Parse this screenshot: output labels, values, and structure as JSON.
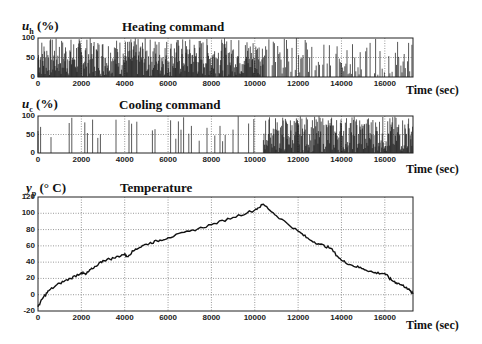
{
  "chart_data": [
    {
      "type": "line",
      "title": "Heating command",
      "ylabel_var": "u",
      "ylabel_sub": "h",
      "ylabel_unit": "(%)",
      "xlabel": "Time (sec)",
      "xlim": [
        0,
        17300
      ],
      "ylim": [
        0,
        100
      ],
      "xticks": [
        0,
        2000,
        4000,
        6000,
        8000,
        10000,
        12000,
        14000,
        16000
      ],
      "yticks": [
        0,
        50,
        100
      ],
      "grid": true,
      "description": "Dense rapidly switching signal between 0 and 100% over entire time span; heavier in first half (0-10400 s), sparser spikes afterwards",
      "segments": [
        {
          "x_start": 0,
          "x_end": 10400,
          "mean": 55,
          "density": "high"
        },
        {
          "x_start": 10400,
          "x_end": 17300,
          "mean": 45,
          "density": "medium"
        }
      ]
    },
    {
      "type": "line",
      "title": "Cooling command",
      "ylabel_var": "u",
      "ylabel_sub": "c",
      "ylabel_unit": "(%)",
      "xlabel": "Time (sec)",
      "xlim": [
        0,
        17300
      ],
      "ylim": [
        0,
        100
      ],
      "xticks": [
        0,
        2000,
        4000,
        6000,
        8000,
        10000,
        12000,
        14000,
        16000
      ],
      "yticks": [
        0,
        50,
        100
      ],
      "grid": true,
      "description": "Sparse spikes 0-100% before ~10400 s, then dense switching after ~10400 s",
      "segments": [
        {
          "x_start": 0,
          "x_end": 10400,
          "mean": 15,
          "density": "low"
        },
        {
          "x_start": 10400,
          "x_end": 17300,
          "mean": 55,
          "density": "high"
        }
      ]
    },
    {
      "type": "line",
      "title": "Temperature",
      "ylabel_var": "y",
      "ylabel_sub": "p",
      "ylabel_unit": "(° C)",
      "xlabel": "Time (sec)",
      "xlim": [
        0,
        17300
      ],
      "ylim": [
        -20,
        120
      ],
      "xticks": [
        0,
        2000,
        4000,
        6000,
        8000,
        10000,
        12000,
        14000,
        16000
      ],
      "yticks": [
        -20,
        0,
        20,
        40,
        60,
        80,
        100,
        120
      ],
      "grid": true,
      "x": [
        0,
        200,
        500,
        1000,
        1500,
        2000,
        2200,
        2500,
        3000,
        3500,
        4000,
        4100,
        4500,
        5000,
        5500,
        6000,
        7000,
        8000,
        9000,
        10000,
        10400,
        11000,
        12000,
        12500,
        13000,
        13500,
        14000,
        14500,
        15000,
        15500,
        16000,
        16300,
        16600,
        17000,
        17300
      ],
      "values": [
        -15,
        -5,
        5,
        14,
        20,
        27,
        25,
        32,
        42,
        45,
        50,
        47,
        56,
        62,
        66,
        70,
        78,
        86,
        95,
        104,
        111,
        97,
        78,
        68,
        62,
        57,
        42,
        36,
        32,
        27,
        26,
        18,
        14,
        9,
        1
      ]
    }
  ],
  "labels": {
    "top_title": "Heating command",
    "mid_title": "Cooling command",
    "bot_title": "Temperature",
    "time_label": "Time (sec)",
    "top_var": "u",
    "top_sub": "h",
    "top_unit": "(%)",
    "mid_var": "u",
    "mid_sub": "c",
    "mid_unit": "(%)",
    "bot_var": "y",
    "bot_sub": "p",
    "bot_unit": "(° C)"
  },
  "colors": {
    "line": "#111111",
    "grid": "#555555",
    "frame": "#222222",
    "background": "#ffffff"
  }
}
